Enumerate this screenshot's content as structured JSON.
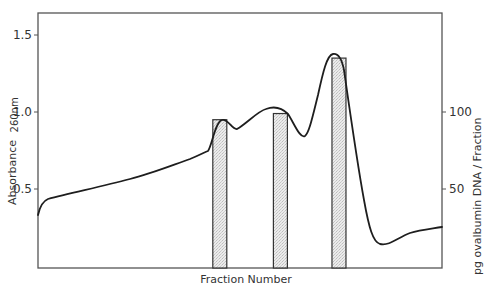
{
  "chart_data": {
    "type": "line",
    "title": "",
    "xlabel": "Fraction Number",
    "ylabel": "Absorbance 260nm",
    "ylabel_main": "Absorbance",
    "ylabel_sub": "260nm",
    "y2label": "pg ovalbumin DNA / Fraction",
    "ylim": [
      0,
      1.65
    ],
    "y2lim": [
      0,
      165
    ],
    "grid": false,
    "legend": null,
    "y_ticks": [
      {
        "value": 0.5,
        "label": "0.5"
      },
      {
        "value": 1.0,
        "label": "1.0"
      },
      {
        "value": 1.5,
        "label": "1.5"
      }
    ],
    "y2_ticks": [
      {
        "value": 50,
        "label": "50"
      },
      {
        "value": 100,
        "label": "100"
      }
    ],
    "series": [
      {
        "name": "Absorbance 260nm",
        "type": "line",
        "axis": "left",
        "x_relative": [
          0.0,
          0.02,
          0.1,
          0.2,
          0.3,
          0.38,
          0.42,
          0.45,
          0.47,
          0.5,
          0.53,
          0.58,
          0.61,
          0.63,
          0.66,
          0.69,
          0.72,
          0.75,
          0.77,
          0.8,
          0.84,
          0.88,
          0.93,
          1.0
        ],
        "values": [
          0.34,
          0.42,
          0.46,
          0.51,
          0.58,
          0.66,
          0.7,
          0.77,
          0.78,
          0.72,
          0.86,
          1.01,
          0.99,
          0.85,
          1.05,
          1.36,
          1.3,
          0.7,
          0.3,
          0.16,
          0.19,
          0.24,
          0.26,
          0.27
        ]
      },
      {
        "name": "pg ovalbumin DNA / Fraction",
        "type": "bar",
        "axis": "right",
        "x_relative": [
          0.45,
          0.6,
          0.745
        ],
        "values": [
          95,
          99,
          135
        ]
      }
    ]
  }
}
